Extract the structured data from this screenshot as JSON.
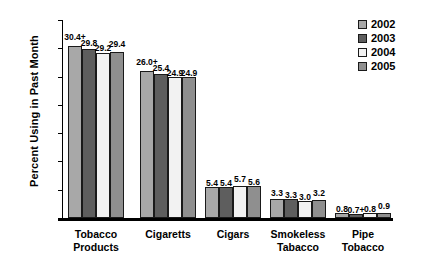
{
  "chart_data": {
    "type": "bar",
    "title": "",
    "xlabel": "",
    "ylabel": "Percent Using in Past Month",
    "ylim": [
      0,
      35
    ],
    "ytick_labels": [
      "0",
      "5",
      "10",
      "15",
      "20",
      "25",
      "30",
      "35"
    ],
    "ytick_values": [
      0,
      5,
      10,
      15,
      20,
      25,
      30,
      35
    ],
    "grid": false,
    "legend_position": "top-right",
    "categories": [
      "Tobacco\nProducts",
      "Cigaretts",
      "Cigars",
      "Smokeless\nTabacco",
      "Pipe\nTobacco"
    ],
    "series": [
      {
        "name": "2002",
        "color": "#a8a8a8",
        "values": [
          30.4,
          26.0,
          5.4,
          3.3,
          0.8
        ],
        "labels": [
          "30.4+",
          "26.0+",
          "5.4",
          "3.3",
          "0.8"
        ]
      },
      {
        "name": "2003",
        "color": "#5e5e5e",
        "values": [
          29.8,
          25.4,
          5.4,
          3.3,
          0.7
        ],
        "labels": [
          "29.8",
          "25.4",
          "5.4",
          "3.3",
          "0.7+"
        ]
      },
      {
        "name": "2004",
        "color": "#f2f2f2",
        "values": [
          29.2,
          24.9,
          5.7,
          3.0,
          0.8
        ],
        "labels": [
          "29.2",
          "24.9",
          "5.7",
          "3.0",
          "0.8"
        ]
      },
      {
        "name": "2005",
        "color": "#8f8f8f",
        "values": [
          29.4,
          24.9,
          5.6,
          3.2,
          0.9
        ],
        "labels": [
          "29.4",
          "24.9",
          "5.6",
          "3.2",
          "0.9"
        ]
      }
    ]
  }
}
